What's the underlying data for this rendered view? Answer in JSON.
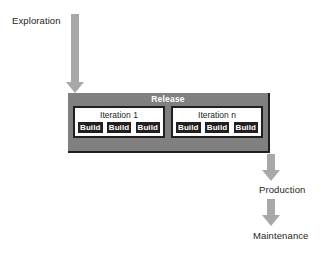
{
  "diagram": {
    "colors": {
      "arrow": "#a8a8a8",
      "release_background": "#808080",
      "build_background": "#231f20",
      "iteration_background": "#ffffff",
      "text": "#231f20",
      "release_title_text": "#ffffff"
    },
    "phases": {
      "exploration": "Exploration",
      "production": "Production",
      "maintenance": "Maintenance"
    },
    "release": {
      "title": "Release",
      "iterations": [
        {
          "title": "Iteration 1",
          "builds": [
            "Build",
            "Build",
            "Build"
          ]
        },
        {
          "title": "Iteration n",
          "builds": [
            "Build",
            "Build",
            "Build"
          ]
        }
      ]
    },
    "arrows": [
      {
        "name": "exploration-arrow",
        "direction": "down"
      },
      {
        "name": "production-arrow",
        "direction": "down"
      },
      {
        "name": "maintenance-arrow",
        "direction": "down"
      }
    ]
  }
}
